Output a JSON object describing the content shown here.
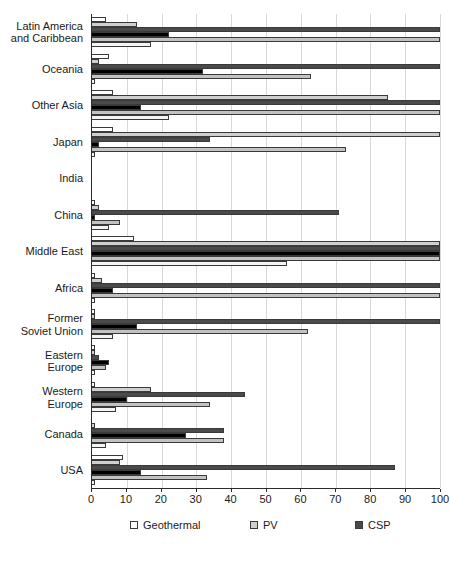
{
  "chart_data": {
    "type": "bar",
    "orientation": "horizontal",
    "title": "",
    "subtitle": "",
    "xlabel": "",
    "ylabel": "",
    "xlim": [
      0,
      100
    ],
    "xticks": [
      0,
      10,
      20,
      30,
      40,
      50,
      60,
      70,
      80,
      90,
      100
    ],
    "xtick_labels": [
      "0",
      "10",
      "20",
      "30",
      "40",
      "50",
      "60",
      "70",
      "80",
      "90",
      "100"
    ],
    "grid": true,
    "grid_axis": "x",
    "legend_position": "bottom",
    "legend_columns": 3,
    "categories": [
      "Latin America\nand Caribbean",
      "Oceania",
      "Other Asia",
      "Japan",
      "India",
      "China",
      "Middle East",
      "Africa",
      "Former\nSoviet Union",
      "Eastern\nEurope",
      "Western\nEurope",
      "Canada",
      "USA"
    ],
    "series": [
      {
        "name": "Geothermal",
        "color": "#ffffff",
        "swatch_class": "s-geothermal",
        "values": [
          4,
          5,
          6,
          6,
          0,
          1,
          12,
          1,
          1,
          1,
          1,
          0,
          9
        ]
      },
      {
        "name": "PV",
        "color": "#cfcfcf",
        "swatch_class": "s-pv",
        "values": [
          13,
          2,
          85,
          100,
          0,
          2,
          100,
          3,
          1,
          1,
          17,
          1,
          8
        ]
      },
      {
        "name": "CSP",
        "color": "#4a4a4a",
        "swatch_class": "s-csp",
        "values": [
          100,
          100,
          100,
          34,
          0,
          71,
          100,
          100,
          100,
          2,
          44,
          38,
          87
        ]
      },
      {
        "name": "Wind",
        "color": "#000000",
        "swatch_class": "s-wind",
        "values": [
          22,
          32,
          14,
          2,
          0,
          1,
          100,
          6,
          13,
          5,
          10,
          27,
          14
        ]
      },
      {
        "name": "Biomass",
        "color": "#c2c2c2",
        "swatch_class": "s-biomass",
        "values": [
          100,
          63,
          100,
          73,
          0,
          8,
          100,
          100,
          62,
          4,
          34,
          38,
          33
        ]
      },
      {
        "name": "Hydro",
        "color": "#f4f4f4",
        "swatch_class": "s-hydro",
        "values": [
          17,
          1,
          22,
          1,
          0,
          5,
          56,
          1,
          6,
          1,
          7,
          4,
          1
        ]
      }
    ]
  },
  "legend": {
    "items": [
      {
        "label": "Geothermal",
        "swatch_class": "s-geothermal"
      },
      {
        "label": "PV",
        "swatch_class": "s-pv"
      },
      {
        "label": "CSP",
        "swatch_class": "s-csp"
      },
      {
        "label": "Wind",
        "swatch_class": "s-wind"
      },
      {
        "label": "Biomass",
        "swatch_class": "s-biomass"
      },
      {
        "label": "Hydro",
        "swatch_class": "s-hydro"
      }
    ]
  }
}
